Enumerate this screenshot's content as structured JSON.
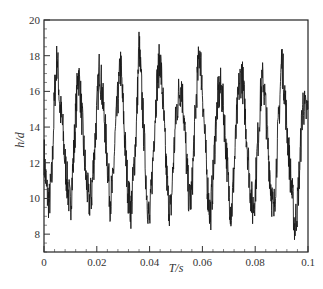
{
  "chart_data": {
    "type": "line",
    "title": "",
    "xlabel": "T/s",
    "ylabel": "h/d",
    "xlim": [
      0,
      0.1
    ],
    "ylim": [
      7,
      20
    ],
    "xticks": [
      0,
      0.02,
      0.04,
      0.06,
      0.08,
      0.1
    ],
    "xtick_labels": [
      "0",
      "0.02",
      "0.04",
      "0.06",
      "0.08",
      "0.1"
    ],
    "yticks": [
      8,
      10,
      12,
      14,
      16,
      18,
      20
    ],
    "ytick_labels": [
      "8",
      "10",
      "12",
      "14",
      "16",
      "18",
      "20"
    ],
    "x_minor_step": 0.004,
    "y_minor_step": 0.5,
    "grid": false,
    "legend": null,
    "line_color": "#1a1a1a",
    "series": [
      {
        "name": "h/d",
        "x": [
          0,
          0.001,
          0.002,
          0.003,
          0.004,
          0.005,
          0.006,
          0.007,
          0.008,
          0.009,
          0.01,
          0.011,
          0.012,
          0.013,
          0.014,
          0.015,
          0.016,
          0.017,
          0.018,
          0.019,
          0.02,
          0.021,
          0.022,
          0.023,
          0.024,
          0.025,
          0.026,
          0.027,
          0.028,
          0.029,
          0.03,
          0.031,
          0.032,
          0.033,
          0.034,
          0.035,
          0.036,
          0.037,
          0.038,
          0.039,
          0.04,
          0.041,
          0.042,
          0.043,
          0.044,
          0.045,
          0.046,
          0.047,
          0.048,
          0.049,
          0.05,
          0.051,
          0.052,
          0.053,
          0.054,
          0.055,
          0.056,
          0.057,
          0.058,
          0.059,
          0.06,
          0.061,
          0.062,
          0.063,
          0.064,
          0.065,
          0.066,
          0.067,
          0.068,
          0.069,
          0.07,
          0.071,
          0.072,
          0.073,
          0.074,
          0.075,
          0.076,
          0.077,
          0.078,
          0.079,
          0.08,
          0.081,
          0.082,
          0.083,
          0.084,
          0.085,
          0.086,
          0.087,
          0.088,
          0.089,
          0.09,
          0.091,
          0.092,
          0.093,
          0.094,
          0.095,
          0.096,
          0.097,
          0.098,
          0.099,
          0.1
        ],
        "values": [
          12.5,
          10.4,
          9.8,
          11.2,
          15.8,
          18.0,
          15.2,
          14.1,
          12.0,
          10.6,
          9.5,
          11.8,
          14.6,
          17.2,
          15.4,
          13.0,
          11.0,
          9.8,
          10.2,
          12.4,
          14.8,
          17.4,
          16.0,
          14.2,
          12.1,
          9.9,
          10.6,
          13.5,
          15.6,
          17.5,
          15.0,
          12.2,
          10.1,
          9.4,
          11.5,
          14.0,
          18.6,
          16.0,
          13.1,
          10.2,
          8.6,
          11.3,
          14.5,
          16.8,
          17.9,
          15.6,
          12.5,
          10.0,
          9.2,
          12.0,
          14.6,
          15.8,
          16.4,
          14.8,
          12.0,
          9.8,
          10.3,
          13.8,
          16.5,
          18.4,
          16.2,
          13.2,
          10.5,
          9.0,
          11.0,
          14.0,
          15.8,
          16.2,
          15.0,
          12.8,
          10.4,
          9.1,
          11.6,
          14.4,
          16.5,
          17.0,
          15.2,
          13.0,
          10.8,
          9.4,
          10.4,
          13.2,
          15.6,
          16.8,
          15.0,
          12.5,
          10.6,
          9.0,
          11.8,
          14.6,
          17.8,
          16.4,
          14.0,
          12.0,
          10.2,
          8.4,
          9.6,
          12.2,
          15.4,
          14.8,
          15.0
        ]
      }
    ]
  },
  "caption": "Fig. … T/s …"
}
